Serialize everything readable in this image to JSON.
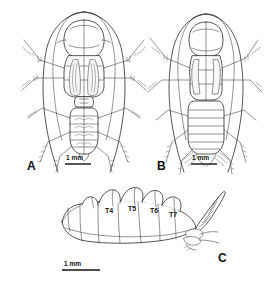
{
  "figure": {
    "background_color": "#ffffff",
    "ink_color": "#2b2b2b",
    "width": 268,
    "height": 283,
    "type": "scientific-line-drawing-plate"
  },
  "panels": [
    {
      "letter": "A",
      "view": "dorsal habitus",
      "scale_bar": {
        "label": "1 mm",
        "length_px": 26
      }
    },
    {
      "letter": "B",
      "view": "ventral habitus",
      "scale_bar": {
        "label": "1 mm",
        "length_px": 26
      }
    },
    {
      "letter": "C",
      "view": "lateral abdomen",
      "scale_bar": {
        "label": "1 mm",
        "length_px": 38
      },
      "segment_labels": [
        "T4",
        "T5",
        "T6",
        "T7"
      ]
    }
  ]
}
